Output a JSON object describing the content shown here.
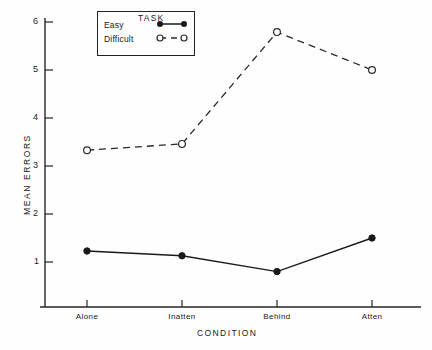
{
  "chart_data": {
    "type": "line",
    "title": "",
    "xlabel": "CONDITION",
    "ylabel": "MEAN ERRORS",
    "categories": [
      "Alone",
      "Inatten",
      "Behind",
      "Atten"
    ],
    "ylim": [
      0,
      6
    ],
    "yticks": [
      1,
      2,
      3,
      4,
      5,
      6
    ],
    "ytick_labels": [
      "1",
      "2",
      "3",
      "4",
      "5",
      "6"
    ],
    "grid": false,
    "legend_position": "top-left",
    "legend_title": "TASK",
    "series": [
      {
        "name": "Easy",
        "values": [
          1.23,
          1.13,
          0.8,
          1.5
        ],
        "marker": "filled-circle",
        "linestyle": "solid",
        "color": "#1a1a1a"
      },
      {
        "name": "Difficult",
        "values": [
          3.33,
          3.46,
          5.79,
          5.0
        ],
        "marker": "open-circle",
        "linestyle": "dashed",
        "color": "#1a1a1a"
      }
    ]
  },
  "axes": {
    "y_tick_label_1": "1",
    "y_tick_label_2": "2",
    "y_tick_label_3": "3",
    "y_tick_label_4": "4",
    "y_tick_label_5": "5",
    "y_tick_label_6": "6",
    "x_cat_1": "Alone",
    "x_cat_2": "Inatten",
    "x_cat_3": "Behind",
    "x_cat_4": "Atten",
    "y_axis_title": "MEAN ERRORS",
    "x_axis_title": "CONDITION"
  },
  "legend": {
    "title": "TASK",
    "entry_easy": "Easy",
    "entry_difficult": "Difficult"
  },
  "colors": {
    "ink": "#1a1a1a",
    "paper": "#fefefe"
  }
}
